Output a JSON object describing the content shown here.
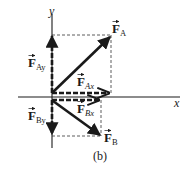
{
  "figure": {
    "caption": "(b)",
    "axes": {
      "x_label": "x",
      "y_label": "y"
    },
    "vectors": [
      {
        "id": "FA",
        "symbol": "F",
        "subscript": "A",
        "style": "solid",
        "role": "resultant"
      },
      {
        "id": "FAx",
        "symbol": "F",
        "subscript": "Ax",
        "style": "dashed",
        "role": "x-component of F_A"
      },
      {
        "id": "FAy",
        "symbol": "F",
        "subscript": "Ay",
        "style": "dashed",
        "role": "y-component of F_A"
      },
      {
        "id": "FB",
        "symbol": "F",
        "subscript": "B",
        "style": "solid",
        "role": "resultant"
      },
      {
        "id": "FBx",
        "symbol": "F",
        "subscript": "Bx",
        "style": "dashed",
        "role": "x-component of F_B"
      },
      {
        "id": "FBy",
        "symbol": "F",
        "subscript": "By",
        "style": "dashed",
        "role": "y-component of F_B"
      }
    ],
    "colors": {
      "ink": "#1a1a1a",
      "guide": "#333333",
      "background": "#ffffff"
    }
  }
}
